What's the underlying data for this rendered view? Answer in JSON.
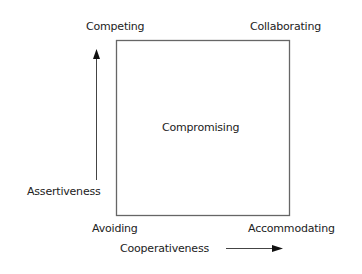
{
  "diagram": {
    "type": "conflict-modes-grid",
    "corners": {
      "top_left": "Competing",
      "top_right": "Collaborating",
      "bottom_left": "Avoiding",
      "bottom_right": "Accommodating"
    },
    "center": "Compromising",
    "axes": {
      "vertical": {
        "label": "Assertiveness",
        "direction": "up"
      },
      "horizontal": {
        "label": "Cooperativeness",
        "direction": "right"
      }
    },
    "colors": {
      "line": "#555555",
      "text": "#222222",
      "arrow": "#111111"
    }
  }
}
